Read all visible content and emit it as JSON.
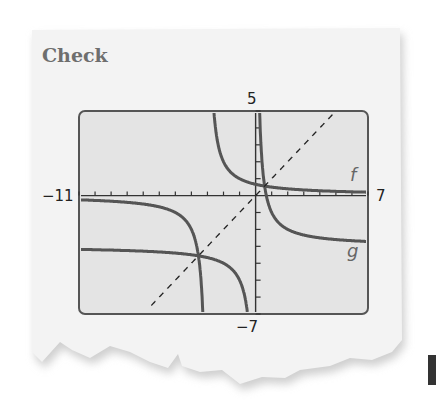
{
  "heading": "Check",
  "colors": {
    "screen_bg": "#e4e4e4",
    "curve": "#555555",
    "frame": "#555555",
    "paper": "#f1f1f1"
  },
  "chart_data": {
    "type": "line",
    "title": "Check",
    "window": {
      "xmin": -11,
      "xmax": 7,
      "ymin": -7,
      "ymax": 5,
      "xscl": 1,
      "yscl": 1
    },
    "tick_labels": {
      "xmin": "−11",
      "xmax": "7",
      "ymax": "5",
      "ymin": "−7"
    },
    "grid": false,
    "series": [
      {
        "name": "f",
        "label": "f",
        "style": "solid",
        "expr": "2/(x+3)",
        "vertical_asymptote": -3,
        "horizontal_asymptote": 0
      },
      {
        "name": "g",
        "label": "g",
        "style": "solid",
        "expr": "2/x - 3",
        "vertical_asymptote": 0,
        "horizontal_asymptote": -3
      },
      {
        "name": "y=x",
        "label": "",
        "style": "dashed",
        "expr": "x",
        "x_range": [
          -6.5,
          4.8
        ]
      }
    ],
    "intersections": [
      {
        "x": 0.56,
        "y": 0.56
      },
      {
        "x": -3.56,
        "y": -3.56
      }
    ]
  }
}
